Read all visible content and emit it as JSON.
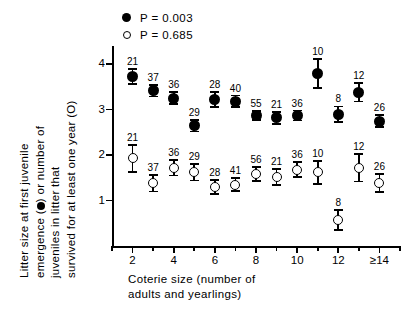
{
  "chart_data": {
    "type": "scatter",
    "title": "",
    "xlabel": "Coterie size (number of adults and yearlings)",
    "ylabel": "Litter size at first juvenile emergence (●) or number of juveniles in litter that survived for at least one year (O)",
    "xlim": [
      1,
      15
    ],
    "ylim": [
      0,
      4.4
    ],
    "yticks": [
      1,
      2,
      3,
      4
    ],
    "xticks": [
      2,
      4,
      6,
      8,
      10,
      12,
      14
    ],
    "xticklabels": [
      "2",
      "4",
      "6",
      "8",
      "10",
      "12",
      "≥14"
    ],
    "x": [
      2,
      3,
      4,
      5,
      6,
      7,
      8,
      9,
      10,
      11,
      12,
      13,
      14
    ],
    "grid": false,
    "legend_position": "top-left",
    "series": [
      {
        "name": "P = 0.003",
        "marker": "filled-circle",
        "values": [
          3.73,
          3.42,
          3.25,
          2.65,
          3.22,
          3.18,
          2.87,
          2.82,
          2.87,
          3.8,
          2.9,
          3.38,
          2.75
        ],
        "errors": [
          0.17,
          0.13,
          0.13,
          0.13,
          0.16,
          0.13,
          0.1,
          0.13,
          0.11,
          0.32,
          0.17,
          0.2,
          0.13
        ],
        "n": [
          21,
          37,
          36,
          29,
          28,
          40,
          55,
          21,
          36,
          10,
          8,
          12,
          26
        ]
      },
      {
        "name": "P = 0.685",
        "marker": "open-circle",
        "values": [
          1.93,
          1.38,
          1.72,
          1.62,
          1.3,
          1.35,
          1.58,
          1.52,
          1.68,
          1.62,
          0.58,
          1.72,
          1.38
        ],
        "errors": [
          0.3,
          0.18,
          0.17,
          0.18,
          0.15,
          0.14,
          0.15,
          0.18,
          0.17,
          0.25,
          0.22,
          0.3,
          0.2
        ],
        "n": [
          21,
          37,
          36,
          29,
          28,
          41,
          56,
          21,
          36,
          10,
          8,
          12,
          26
        ]
      }
    ]
  },
  "legend": {
    "entries": [
      {
        "marker": "filled-circle",
        "label": "P  =  0.003"
      },
      {
        "marker": "open-circle",
        "label": "P  =  0.685"
      }
    ]
  },
  "axis_titles": {
    "x_lines": [
      "Coterie  size  (number  of",
      "adults  and  yearlings)"
    ],
    "y_lines": [
      "Litter  size  at  first  juvenile",
      "emergence  (●)  or  number  of",
      "juveniles  in  litter  that",
      "survived  for  at  least  one  year  (O)"
    ]
  }
}
